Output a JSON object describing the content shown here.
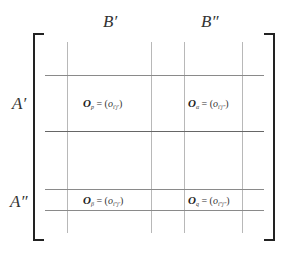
{
  "diagram": {
    "column_labels": [
      {
        "text": "B′",
        "x": 103,
        "y": 13
      },
      {
        "text": "B″",
        "x": 201,
        "y": 13
      }
    ],
    "row_labels": [
      {
        "text": "A′",
        "x": 12,
        "y": 95
      },
      {
        "text": "A″",
        "x": 10,
        "y": 193
      }
    ],
    "blocks": [
      {
        "symbol": "O",
        "sub": "p",
        "rhs_var": "o",
        "rhs_sub": "i′j′",
        "x": 83,
        "y": 98
      },
      {
        "symbol": "O",
        "sub": "α",
        "rhs_var": "o",
        "rhs_sub": "i′j″",
        "x": 188,
        "y": 98
      },
      {
        "symbol": "O",
        "sub": "β",
        "rhs_var": "o",
        "rhs_sub": "i″j′",
        "x": 83,
        "y": 195
      },
      {
        "symbol": "O",
        "sub": "q",
        "rhs_var": "o",
        "rhs_sub": "i″j″",
        "x": 188,
        "y": 195
      }
    ],
    "equals": "=",
    "open_paren": "(",
    "close_paren": ")",
    "grid": {
      "vertical_x": [
        67,
        151,
        184,
        242
      ],
      "vertical_top": 42,
      "vertical_bottom": 233,
      "horizontal_y": [
        75,
        131,
        189,
        210
      ],
      "horizontal_left": 45,
      "horizontal_right": 264
    },
    "colors": {
      "bracket": "#222222",
      "grid_vertical": "#b8b8b8",
      "grid_horizontal": "#8a8a8a",
      "text": "#333333"
    }
  }
}
